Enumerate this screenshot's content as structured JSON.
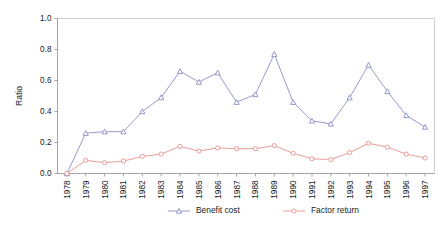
{
  "chart_data": {
    "type": "line",
    "title": "",
    "xlabel": "",
    "ylabel": "Ratio",
    "ylim": [
      0.0,
      1.0
    ],
    "yticks": [
      "0.0",
      "0.2",
      "0.4",
      "0.6",
      "0.8",
      "1.0"
    ],
    "ytick_values": [
      0.0,
      0.2,
      0.4,
      0.6,
      0.8,
      1.0
    ],
    "grid": false,
    "legend_position": "bottom-center",
    "categories": [
      "1978",
      "1979",
      "1980",
      "1981",
      "1982",
      "1983",
      "1984",
      "1985",
      "1986",
      "1987",
      "1988",
      "1989",
      "1990",
      "1991",
      "1992",
      "1993",
      "1994",
      "1995",
      "1996",
      "1997"
    ],
    "series": [
      {
        "name": "Benefit cost",
        "color": "#8b8fc4",
        "marker": "triangle",
        "values": [
          0.0,
          0.26,
          0.27,
          0.27,
          0.4,
          0.49,
          0.66,
          0.59,
          0.65,
          0.46,
          0.51,
          0.77,
          0.46,
          0.34,
          0.32,
          0.49,
          0.7,
          0.53,
          0.375,
          0.3
        ]
      },
      {
        "name": "Factor return",
        "color": "#e8928f",
        "marker": "circle",
        "values": [
          0.0,
          0.085,
          0.07,
          0.08,
          0.11,
          0.125,
          0.175,
          0.145,
          0.165,
          0.16,
          0.16,
          0.18,
          0.13,
          0.095,
          0.09,
          0.135,
          0.195,
          0.17,
          0.125,
          0.1
        ]
      }
    ]
  },
  "legend": {
    "items": [
      {
        "label": "Benefit cost",
        "color": "#8b8fc4",
        "marker": "triangle"
      },
      {
        "label": "Factor return",
        "color": "#e8928f",
        "marker": "circle"
      }
    ]
  },
  "colors": {
    "benefit_cost": "#8b8fc4",
    "factor_return": "#e8928f",
    "axis": "#9a9a9a",
    "frame": "#c9c9c9",
    "text": "#1a1a1a",
    "background": "#ffffff"
  }
}
